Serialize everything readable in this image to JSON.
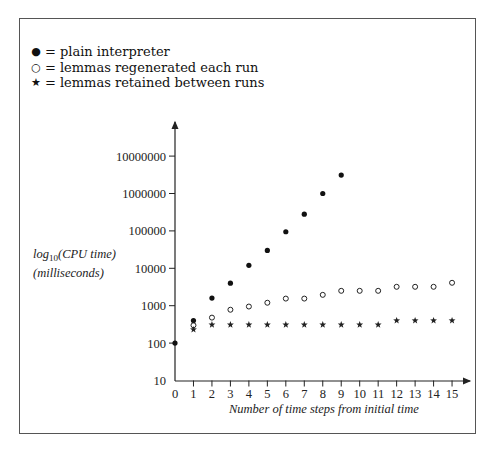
{
  "legend": [
    {
      "symbol": "●",
      "label": "plain interpreter",
      "marker": "filled-circle"
    },
    {
      "symbol": "○",
      "label": "lemmas regenerated each run",
      "marker": "open-circle"
    },
    {
      "symbol": "★",
      "label": "lemmas retained between runs",
      "marker": "star"
    }
  ],
  "legend_eq": "=",
  "chart_data": {
    "type": "scatter",
    "title": "",
    "xlabel": "Number of time steps from initial time",
    "ylabel_line1": "log10(CPU time)",
    "ylabel_line2": "(milliseconds)",
    "yscale": "log",
    "xlim": [
      0,
      15
    ],
    "ylim": [
      10,
      10000000
    ],
    "grid": false,
    "legend_position": "top-left",
    "x_ticks": [
      "0",
      "1",
      "2",
      "3",
      "4",
      "5",
      "6",
      "7",
      "8",
      "9",
      "10",
      "11",
      "12",
      "13",
      "14",
      "15"
    ],
    "y_ticks": [
      "10",
      "100",
      "1000",
      "10000",
      "100000",
      "1000000",
      "10000000"
    ],
    "series": [
      {
        "name": "plain interpreter",
        "marker": "filled-circle",
        "x": [
          0,
          1,
          2,
          3,
          4,
          5,
          6,
          7,
          8,
          9
        ],
        "values": [
          100,
          400,
          1600,
          4000,
          12000,
          30000,
          95000,
          280000,
          1000000,
          3100000
        ]
      },
      {
        "name": "lemmas regenerated each run",
        "marker": "open-circle",
        "x": [
          1,
          2,
          3,
          4,
          5,
          6,
          7,
          8,
          9,
          10,
          11,
          12,
          13,
          14,
          15
        ],
        "values": [
          300,
          480,
          780,
          950,
          1200,
          1550,
          1550,
          1950,
          2500,
          2500,
          2500,
          3200,
          3200,
          3200,
          4100
        ]
      },
      {
        "name": "lemmas retained between runs",
        "marker": "star",
        "x": [
          1,
          2,
          3,
          4,
          5,
          6,
          7,
          8,
          9,
          10,
          11,
          12,
          13,
          14,
          15
        ],
        "values": [
          230,
          310,
          310,
          310,
          310,
          310,
          310,
          310,
          310,
          310,
          310,
          400,
          400,
          400,
          400
        ]
      }
    ]
  }
}
